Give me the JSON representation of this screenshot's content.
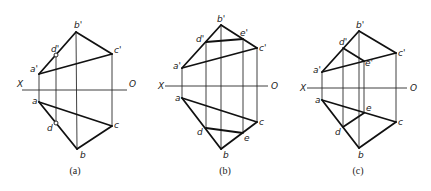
{
  "figures": [
    {
      "id": "a",
      "caption": "(a)",
      "axis": {
        "x1": 22,
        "x2": 127,
        "y": 90,
        "left_label": "X",
        "right_label": "O",
        "left_label_pos": [
          17,
          87
        ],
        "right_label_pos": [
          129,
          87
        ]
      },
      "points": {
        "a_p": {
          "label": "a'",
          "x": 39,
          "y": 74,
          "lx": 30,
          "ly": 72
        },
        "b_p": {
          "label": "b'",
          "x": 76,
          "y": 32,
          "lx": 74,
          "ly": 28
        },
        "c_p": {
          "label": "c'",
          "x": 112,
          "y": 54,
          "lx": 114,
          "ly": 53
        },
        "d_p": {
          "label": "d'",
          "x": 56,
          "y": 55,
          "lx": 51,
          "ly": 52
        },
        "a": {
          "label": "a",
          "x": 39,
          "y": 102,
          "lx": 32,
          "ly": 104
        },
        "b": {
          "label": "b",
          "x": 77,
          "y": 149,
          "lx": 80,
          "ly": 158
        },
        "c": {
          "label": "c",
          "x": 112,
          "y": 126,
          "lx": 114,
          "ly": 128
        },
        "d": {
          "label": "d",
          "x": 56,
          "y": 123,
          "lx": 47,
          "ly": 131
        }
      },
      "caption_pos": [
        75,
        174
      ]
    },
    {
      "id": "b",
      "caption": "(b)",
      "axis": {
        "x1": 165,
        "x2": 268,
        "y": 86,
        "left_label": "X",
        "right_label": "O",
        "left_label_pos": [
          158,
          89
        ],
        "right_label_pos": [
          271,
          89
        ]
      },
      "points": {
        "a_p": {
          "label": "a'",
          "x": 182,
          "y": 68,
          "lx": 173,
          "ly": 69
        },
        "b_p": {
          "label": "b'",
          "x": 221,
          "y": 25,
          "lx": 217,
          "ly": 22
        },
        "c_p": {
          "label": "c'",
          "x": 257,
          "y": 48,
          "lx": 259,
          "ly": 51
        },
        "d_p": {
          "label": "d'",
          "x": 206,
          "y": 42,
          "lx": 196,
          "ly": 42
        },
        "e_p": {
          "label": "e'",
          "x": 243,
          "y": 39,
          "lx": 240,
          "ly": 36
        },
        "a": {
          "label": "a",
          "x": 182,
          "y": 98,
          "lx": 175,
          "ly": 101
        },
        "b": {
          "label": "b",
          "x": 221,
          "y": 149,
          "lx": 223,
          "ly": 158
        },
        "c": {
          "label": "c",
          "x": 257,
          "y": 122,
          "lx": 259,
          "ly": 125
        },
        "d": {
          "label": "d",
          "x": 206,
          "y": 128,
          "lx": 197,
          "ly": 135
        },
        "e": {
          "label": "e",
          "x": 243,
          "y": 133,
          "lx": 244,
          "ly": 141
        }
      },
      "caption_pos": [
        225,
        174
      ]
    },
    {
      "id": "c",
      "caption": "(c)",
      "axis": {
        "x1": 307,
        "x2": 407,
        "y": 88,
        "left_label": "X",
        "right_label": "O",
        "left_label_pos": [
          300,
          91
        ],
        "right_label_pos": [
          410,
          91
        ]
      },
      "points": {
        "a_p": {
          "label": "a'",
          "x": 322,
          "y": 72,
          "lx": 313,
          "ly": 73
        },
        "b_p": {
          "label": "b'",
          "x": 359,
          "y": 31,
          "lx": 356,
          "ly": 28
        },
        "c_p": {
          "label": "c'",
          "x": 396,
          "y": 53,
          "lx": 398,
          "ly": 56
        },
        "d_p": {
          "label": "d'",
          "x": 343,
          "y": 48,
          "lx": 339,
          "ly": 45
        },
        "e_p": {
          "label": "e'",
          "x": 364,
          "y": 61,
          "lx": 365,
          "ly": 66
        },
        "a": {
          "label": "a",
          "x": 322,
          "y": 100,
          "lx": 315,
          "ly": 103
        },
        "b": {
          "label": "b",
          "x": 359,
          "y": 148,
          "lx": 358,
          "ly": 158
        },
        "c": {
          "label": "c",
          "x": 396,
          "y": 122,
          "lx": 398,
          "ly": 125
        },
        "d": {
          "label": "d",
          "x": 343,
          "y": 127,
          "lx": 335,
          "ly": 135
        },
        "e": {
          "label": "e",
          "x": 364,
          "y": 113,
          "lx": 366,
          "ly": 111
        }
      },
      "caption_pos": [
        358,
        174
      ]
    }
  ]
}
